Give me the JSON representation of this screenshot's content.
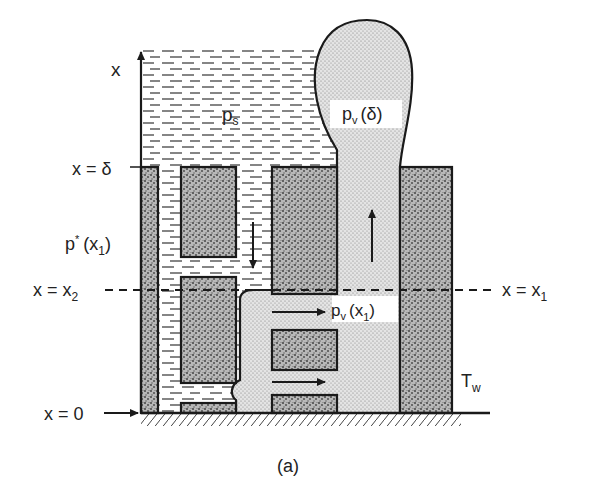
{
  "figure": {
    "caption": "(a)",
    "axis_label": "x",
    "labels": {
      "x_delta": "x = δ",
      "x_x2": "x = x",
      "x_x2_sub": "2",
      "x_zero": "x = 0",
      "x_x1": "x = x",
      "x_x1_sub": "1",
      "p_star": "p",
      "p_star_sup": "*",
      "p_star_arg": "(x",
      "p_star_arg_sub": "1",
      "p_star_close": ")",
      "p_s": "p",
      "p_s_sub": "s",
      "p_v_delta": "p",
      "p_v_delta_sub": "v",
      "p_v_delta_arg": "(δ)",
      "p_v_x1": "p",
      "p_v_x1_sub": "v",
      "p_v_x1_arg": "(x",
      "p_v_x1_arg_sub": "1",
      "p_v_x1_close": ")",
      "t_w": "T",
      "t_w_sub": "w"
    },
    "regions": {
      "liquid": "liquid pool (dashed hatching)",
      "vapor": "vapor (fine stipple)",
      "solid": "porous solid (coarse stipple)"
    },
    "colors": {
      "ink": "#1a1a1a",
      "solid_fill": "#9a9a9a",
      "vapor_fill": "#d6d6d6",
      "background": "#ffffff"
    }
  }
}
